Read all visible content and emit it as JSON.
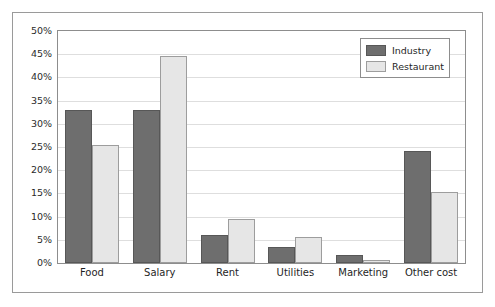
{
  "chart_data": {
    "type": "bar",
    "title": "",
    "xlabel": "",
    "ylabel": "",
    "categories": [
      "Food",
      "Salary",
      "Rent",
      "Utilities",
      "Marketing",
      "Other cost"
    ],
    "series": [
      {
        "name": "Industry",
        "color": "#6e6e6e",
        "values": [
          33.0,
          33.0,
          6.0,
          3.5,
          1.8,
          24.2
        ]
      },
      {
        "name": "Restaurant",
        "color": "#e6e6e6",
        "values": [
          25.5,
          44.7,
          9.5,
          5.5,
          0.6,
          15.2
        ]
      }
    ],
    "ylim": [
      0,
      50
    ],
    "ytick_values": [
      0,
      5,
      10,
      15,
      20,
      25,
      30,
      35,
      40,
      45,
      50
    ],
    "ytick_labels": [
      "0%",
      "5%",
      "10%",
      "15%",
      "20%",
      "25%",
      "30%",
      "35%",
      "40%",
      "45%",
      "50%"
    ],
    "value_suffix": "%",
    "grid": true,
    "grid_axis": "y",
    "legend_position": "top-right",
    "legend_entries": [
      "Industry",
      "Restaurant"
    ],
    "frame": true,
    "plot_border_color": "#8d8d8d",
    "grid_color": "#dedede",
    "background_color": "#ffffff"
  }
}
